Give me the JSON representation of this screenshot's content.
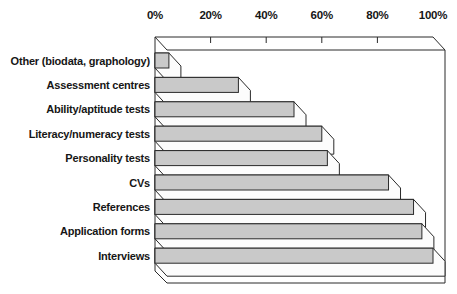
{
  "chart_data": {
    "type": "bar",
    "orientation": "horizontal",
    "effect": "3d",
    "title": "",
    "categories": [
      "Other (biodata, graphology)",
      "Assessment centres",
      "Ability/aptitude tests",
      "Literacy/numeracy tests",
      "Personality tests",
      "CVs",
      "References",
      "Application forms",
      "Interviews"
    ],
    "values": [
      5,
      30,
      50,
      60,
      62,
      84,
      93,
      96,
      100
    ],
    "value_unit": "%",
    "x_axis": {
      "position": "top",
      "range": [
        0,
        100
      ],
      "tick_values": [
        0,
        20,
        40,
        60,
        80,
        100
      ],
      "tick_labels": [
        "0%",
        "20%",
        "40%",
        "60%",
        "80%",
        "100%"
      ]
    },
    "grid": "off",
    "legend": "none",
    "style": {
      "bar_fill": "#c9c9c9",
      "bar_end_fill": "#fcfcfc",
      "plot_fill": "#ffffff",
      "outline": "#2a2a2a",
      "background": "#ffffff",
      "label_color": "#161616"
    }
  }
}
